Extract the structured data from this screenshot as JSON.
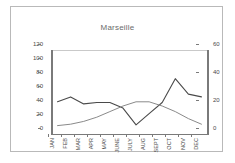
{
  "chart_data": {
    "type": "line",
    "title": "Marseille",
    "xlabel": "",
    "ylabel": "",
    "categories": [
      "JAN",
      "FEB",
      "MAR",
      "APR",
      "MAY",
      "JUNE",
      "JULY",
      "AUG",
      "SEPT",
      "OCT",
      "NOV",
      "DEC"
    ],
    "grid": false,
    "legend": "none",
    "axes": {
      "left": {
        "ticks": [
          "0",
          "20",
          "40",
          "60",
          "80",
          "100",
          "120"
        ],
        "values": [
          0,
          20,
          40,
          60,
          80,
          100,
          120
        ],
        "ylim": [
          0,
          120
        ]
      },
      "right": {
        "ticks": [
          "0",
          "20",
          "40",
          "60"
        ],
        "values": [
          0,
          20,
          40,
          60
        ],
        "ylim": [
          0,
          60
        ]
      }
    },
    "series": [
      {
        "name": "precipitation",
        "axis": "left",
        "color": "#4a4a4a",
        "values": [
          46,
          53,
          43,
          45,
          45,
          37,
          13,
          29,
          45,
          79,
          57,
          53
        ]
      },
      {
        "name": "temperature",
        "axis": "right",
        "color": "#8a8a8a",
        "values": [
          6,
          7,
          9,
          12,
          16,
          20,
          23,
          23,
          20,
          16,
          11,
          7
        ]
      }
    ]
  }
}
